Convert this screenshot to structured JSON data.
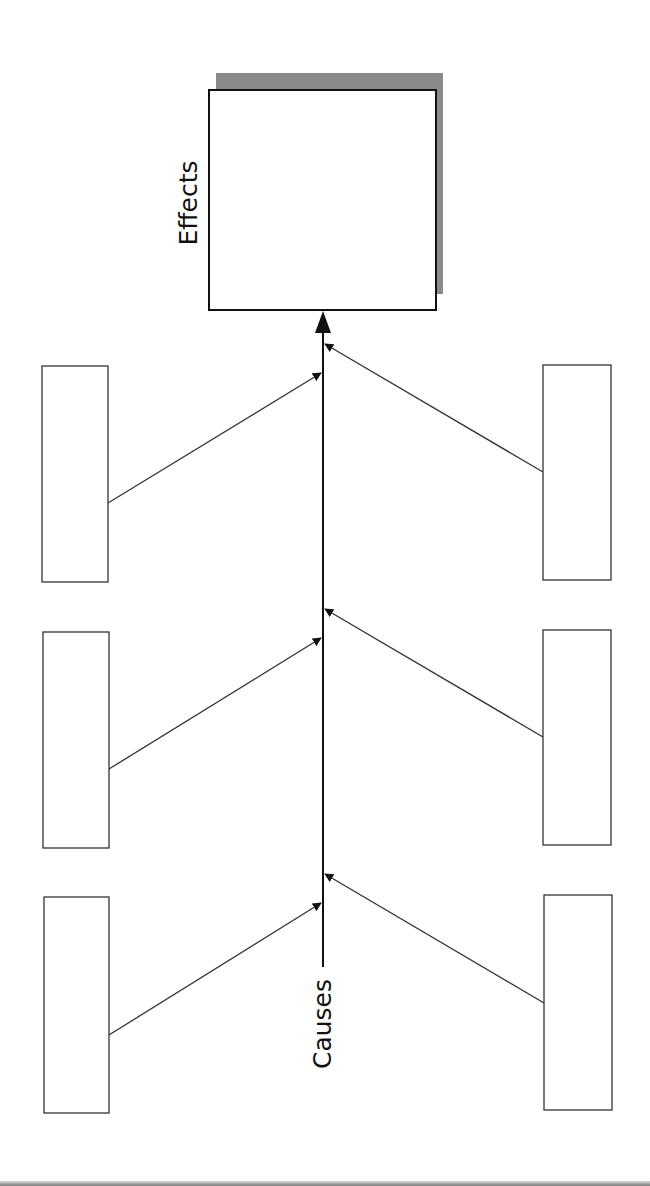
{
  "diagram": {
    "type": "fishbone (cause-and-effect) diagram, rotated vertically",
    "effect_label": "Effects",
    "cause_label": "Causes",
    "colors": {
      "stroke": "#111111",
      "branch_stroke": "#333333",
      "box_fill": "#ffffff",
      "shadow": "#8a8a8a",
      "background": "#ffffff"
    },
    "effect_box": {
      "x": 209,
      "y": 90,
      "w": 227,
      "h": 220
    },
    "effect_shadow": {
      "x": 216,
      "y": 73,
      "w": 227,
      "h": 221
    },
    "spine": {
      "x": 323,
      "y1": 967,
      "y2": 312
    },
    "cause_boxes": [
      {
        "id": "top-left",
        "side": "left",
        "x": 42,
        "y": 366,
        "w": 66,
        "h": 216,
        "label": ""
      },
      {
        "id": "top-right",
        "side": "right",
        "x": 543,
        "y": 365,
        "w": 68,
        "h": 215,
        "label": ""
      },
      {
        "id": "middle-left",
        "side": "left",
        "x": 43,
        "y": 632,
        "w": 66,
        "h": 216,
        "label": ""
      },
      {
        "id": "middle-right",
        "side": "right",
        "x": 543,
        "y": 630,
        "w": 68,
        "h": 215,
        "label": ""
      },
      {
        "id": "bottom-left",
        "side": "left",
        "x": 44,
        "y": 897,
        "w": 65,
        "h": 216,
        "label": ""
      },
      {
        "id": "bottom-right",
        "side": "right",
        "x": 544,
        "y": 895,
        "w": 68,
        "h": 215,
        "label": ""
      }
    ],
    "branches": [
      {
        "from": "top-left",
        "x1": 108,
        "y1": 503,
        "x2": 321,
        "y2": 373
      },
      {
        "from": "top-right",
        "x1": 543,
        "y1": 472,
        "x2": 325,
        "y2": 344
      },
      {
        "from": "middle-left",
        "x1": 109,
        "y1": 769,
        "x2": 321,
        "y2": 638
      },
      {
        "from": "middle-right",
        "x1": 543,
        "y1": 737,
        "x2": 325,
        "y2": 609
      },
      {
        "from": "bottom-left",
        "x1": 109,
        "y1": 1035,
        "x2": 321,
        "y2": 903
      },
      {
        "from": "bottom-right",
        "x1": 544,
        "y1": 1003,
        "x2": 325,
        "y2": 874
      }
    ]
  }
}
